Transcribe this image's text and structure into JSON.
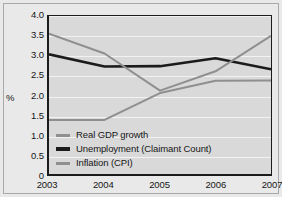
{
  "chart_data": {
    "type": "line",
    "title": "",
    "xlabel": "",
    "ylabel": "%",
    "x": [
      "2003",
      "2004",
      "2005",
      "2006",
      "2007"
    ],
    "categories": [
      "2003",
      "2004",
      "2005",
      "2006",
      "2007"
    ],
    "ylim": [
      0,
      4.0
    ],
    "yticks": [
      "0",
      "0.5",
      "1.0",
      "1.5",
      "2.0",
      "2.5",
      "3.0",
      "3.5",
      "4.0"
    ],
    "ytick_values": [
      0,
      0.5,
      1.0,
      1.5,
      2.0,
      2.5,
      3.0,
      3.5,
      4.0
    ],
    "grid": true,
    "grid_axis": "y",
    "legend_position": "inside-lower-left",
    "series": [
      {
        "name": "Real GDP growth",
        "color": "#8f8f8f",
        "width": 2,
        "values": [
          1.37,
          1.37,
          2.05,
          2.36,
          2.37
        ]
      },
      {
        "name": "Unemployment (Claimant Count)",
        "color": "#1b1b1b",
        "width": 2.6,
        "values": [
          3.03,
          2.72,
          2.73,
          2.93,
          2.65
        ]
      },
      {
        "name": "Inflation (CPI)",
        "color": "#8f8f8f",
        "width": 2,
        "values": [
          3.55,
          3.05,
          2.11,
          2.6,
          3.5
        ]
      }
    ]
  },
  "colors": {
    "figure_background": "#e9e9e9",
    "plot_background": "#d9d9d9",
    "gridline": "#f2f2f2",
    "axis": "#1b1b1b",
    "text": "#161616",
    "series_gray": "#8f8f8f",
    "series_black": "#1b1b1b"
  }
}
